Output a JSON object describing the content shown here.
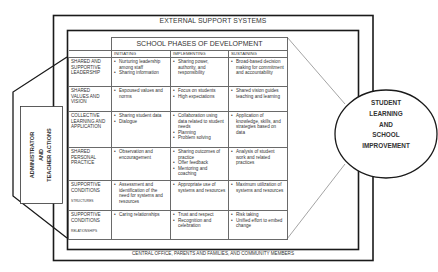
{
  "diagram": {
    "outer_box_label": "EXTERNAL SUPPORT SYSTEMS",
    "bottom_label": "CENTRAL OFFICE, PARENTS AND FAMILIES, AND COMMUNITY MEMBERS",
    "left_actor": {
      "line1": "ADMINISTRATOR",
      "line2": "AND",
      "line3": "TEACHER ACTIONS"
    },
    "outcome": {
      "lines": [
        "STUDENT",
        "LEARNING",
        "AND",
        "SCHOOL",
        "IMPROVEMENT"
      ]
    },
    "table": {
      "title": "SCHOOL PHASES OF DEVELOPMENT",
      "phases": [
        "INITIATING",
        "IMPLEMENTING",
        "SUSTAINING"
      ],
      "rows": [
        {
          "label": "SHARED AND SUPPORTIVE LEADERSHIP",
          "sublabel": "",
          "initiating": [
            "Nurturing leadership among staff",
            "Sharing information"
          ],
          "implementing": [
            "Sharing power, authority, and responsibility"
          ],
          "sustaining": [
            "Broad-based decision making for commitment and accountability"
          ]
        },
        {
          "label": "SHARED VALUES AND VISION",
          "sublabel": "",
          "initiating": [
            "Espoused values and norms"
          ],
          "implementing": [
            "Focus on students",
            "High expectations"
          ],
          "sustaining": [
            "Shared vision guides teaching and learning"
          ]
        },
        {
          "label": "COLLECTIVE LEARNING AND APPLICATION",
          "sublabel": "",
          "initiating": [
            "Sharing student data",
            "Dialogue"
          ],
          "implementing": [
            "Collaboration using data related to student needs",
            "Planning",
            "Problem solving"
          ],
          "sustaining": [
            "Application of knowledge, skills, and strategies based on data"
          ]
        },
        {
          "label": "SHARED PERSONAL PRACTICE",
          "sublabel": "",
          "initiating": [
            "Observation and encouragement"
          ],
          "implementing": [
            "Sharing outcomes of practice",
            "Offer feedback",
            "Mentoring and coaching"
          ],
          "sustaining": [
            "Analysis of student work and related practices"
          ]
        },
        {
          "label": "SUPPORTIVE CONDITIONS",
          "sublabel": "STRUCTURES",
          "initiating": [
            "Assessment and identification of the need for systems and resources"
          ],
          "implementing": [
            "Appropriate use of systems and resources"
          ],
          "sustaining": [
            "Maximum utilization of systems and resources"
          ]
        },
        {
          "label": "SUPPORTIVE CONDITIONS",
          "sublabel": "RELATIONSHIPS",
          "initiating": [
            "Caring relationships"
          ],
          "implementing": [
            "Trust and respect",
            "Recognition and celebration"
          ],
          "sustaining": [
            "Risk taking",
            "Unified effort to embed change"
          ]
        }
      ]
    }
  }
}
